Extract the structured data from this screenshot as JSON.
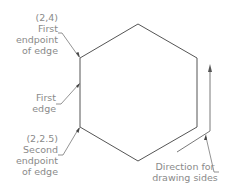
{
  "diagram": {
    "type": "hexagon-edge-annotation",
    "line_color": "#555555",
    "text_color": "#8a8a8a",
    "labels": {
      "first_endpoint": {
        "coord": "(2,4)",
        "line1": "First",
        "line2": "endpoint",
        "line3": "of edge"
      },
      "first_edge": {
        "line1": "First",
        "line2": "edge"
      },
      "second_endpoint": {
        "coord": "(2,2.5)",
        "line1": "Second",
        "line2": "endpoint",
        "line3": "of edge"
      },
      "direction": {
        "line1": "Direction for",
        "line2": "drawing sides"
      }
    },
    "hexagon_vertices": [
      [
        80,
        58
      ],
      [
        138,
        24
      ],
      [
        197,
        58
      ],
      [
        197,
        127
      ],
      [
        138,
        161
      ],
      [
        80,
        127
      ]
    ]
  }
}
